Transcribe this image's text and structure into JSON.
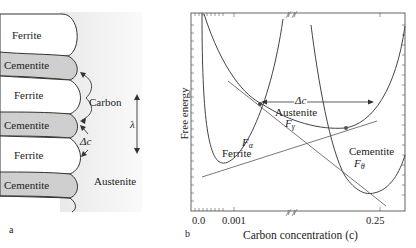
{
  "panel_a": {
    "label": "a",
    "layers": [
      {
        "name": "Ferrite",
        "type": "ferrite"
      },
      {
        "name": "Cementite",
        "type": "cementite"
      },
      {
        "name": "Ferrite",
        "type": "ferrite"
      },
      {
        "name": "Cementite",
        "type": "cementite"
      },
      {
        "name": "Ferrite",
        "type": "ferrite"
      },
      {
        "name": "Cementite",
        "type": "cementite"
      }
    ],
    "annotations": {
      "carbon": "Carbon",
      "delta_c": "Δc",
      "lambda": "λ",
      "austenite": "Austenite"
    },
    "colors": {
      "cementite_fill": "#cfcfcf",
      "background_gradient": "#f2f2f2",
      "outline": "#333333"
    }
  },
  "panel_b": {
    "label": "b",
    "xlabel": "Carbon concentration (c)",
    "ylabel": "Free energy",
    "x_ticks": [
      "0.0",
      "0.001",
      "0.25"
    ],
    "curves": {
      "ferrite": {
        "symbol": "F",
        "sub": "α",
        "name": "Ferrite"
      },
      "austenite": {
        "symbol": "F",
        "sub": "γ",
        "name": "Austenite"
      },
      "cementite": {
        "symbol": "F",
        "sub": "θ",
        "name": "Cementite"
      }
    },
    "delta_c": "Δc",
    "axis_break_symbol": "≈"
  }
}
